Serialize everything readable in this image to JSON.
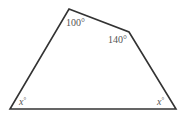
{
  "diagram": {
    "type": "quadrilateral",
    "stroke_color": "#333333",
    "label_color": "#555555",
    "vertices": {
      "top_left": {
        "x": 69,
        "y": 9
      },
      "top_right": {
        "x": 129,
        "y": 32
      },
      "bottom_right": {
        "x": 176,
        "y": 109
      },
      "bottom_left": {
        "x": 10,
        "y": 109
      }
    },
    "angles": {
      "top_left": {
        "value": "100",
        "unit": "°",
        "text": "100°"
      },
      "top_right": {
        "value": "140",
        "unit": "°",
        "text": "140°"
      },
      "bottom_left": {
        "var": "x",
        "unit": "°"
      },
      "bottom_right": {
        "var": "x",
        "unit": "°"
      }
    }
  }
}
